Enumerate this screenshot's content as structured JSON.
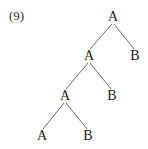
{
  "example_number": "(9)",
  "tree": {
    "nodes": [
      {
        "id": "n0",
        "label": "A",
        "x": 113,
        "y": 21
      },
      {
        "id": "n1",
        "label": "A",
        "x": 89,
        "y": 60
      },
      {
        "id": "n2",
        "label": "B",
        "x": 135,
        "y": 60
      },
      {
        "id": "n3",
        "label": "A",
        "x": 65,
        "y": 100
      },
      {
        "id": "n4",
        "label": "B",
        "x": 112,
        "y": 100
      },
      {
        "id": "n5",
        "label": "A",
        "x": 42,
        "y": 140
      },
      {
        "id": "n6",
        "label": "B",
        "x": 88,
        "y": 140
      }
    ],
    "edges": [
      {
        "from": "n0",
        "to": "n1",
        "x1": 112,
        "y1": 24,
        "x2": 90,
        "y2": 49
      },
      {
        "from": "n0",
        "to": "n2",
        "x1": 114,
        "y1": 24,
        "x2": 134,
        "y2": 49
      },
      {
        "from": "n1",
        "to": "n3",
        "x1": 88,
        "y1": 63,
        "x2": 66,
        "y2": 89
      },
      {
        "from": "n1",
        "to": "n4",
        "x1": 90,
        "y1": 63,
        "x2": 111,
        "y2": 89
      },
      {
        "from": "n3",
        "to": "n5",
        "x1": 64,
        "y1": 103,
        "x2": 43,
        "y2": 129
      },
      {
        "from": "n3",
        "to": "n6",
        "x1": 66,
        "y1": 103,
        "x2": 87,
        "y2": 129
      }
    ]
  }
}
